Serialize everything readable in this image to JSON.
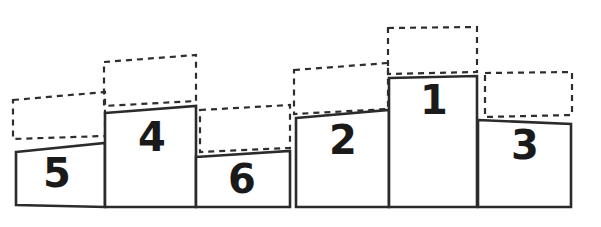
{
  "figure": {
    "background_color": "#ffffff",
    "line_color": "#2b2b2b",
    "dashed_color": "#2e2e2e",
    "label_color": "#1a1a1a",
    "width": 601,
    "height": 227
  },
  "chart_data": {
    "type": "bar",
    "xlabel": "",
    "ylabel": "",
    "grid": false,
    "legend": "none",
    "note": "Two podium groups drawn in perspective. Each solid block carries a rank number; an empty dashed rectangle placeholder sits directly above each block.",
    "categories": [
      "5",
      "4",
      "6",
      "2",
      "1",
      "3"
    ],
    "values": [
      55,
      97,
      51,
      92,
      130,
      85
    ],
    "groups": [
      {
        "name": "left-podium",
        "ranks": [
          "5",
          "4",
          "6"
        ]
      },
      {
        "name": "right-podium",
        "ranks": [
          "2",
          "1",
          "3"
        ]
      }
    ]
  },
  "groups": [
    {
      "id": "left-podium",
      "name": "Left podium group",
      "blocks": [
        {
          "rank": "5",
          "name": "podium-block-5",
          "block_points": "16,152 105,143 105,207 16,205",
          "label_x": 57,
          "label_y": 176,
          "label_size": 40,
          "placeholder_points": "13,100 105,92 105,136 13,139",
          "placeholder_name": "placeholder-above-5"
        },
        {
          "rank": "4",
          "name": "podium-block-4",
          "block_points": "105,113 196,106 196,207 105,207",
          "label_x": 152,
          "label_y": 140,
          "label_size": 44,
          "placeholder_points": "104,62 196,55 196,101 104,106",
          "placeholder_name": "placeholder-above-4"
        },
        {
          "rank": "6",
          "name": "podium-block-6",
          "block_points": "196,157 290,151 290,207 196,207",
          "label_x": 242,
          "label_y": 182,
          "label_size": 40,
          "placeholder_points": "200,110 290,105 290,148 200,152",
          "placeholder_name": "placeholder-above-6"
        }
      ]
    },
    {
      "id": "right-podium",
      "name": "Right podium group",
      "blocks": [
        {
          "rank": "2",
          "name": "podium-block-2",
          "block_points": "296,118 389,110 389,207 296,207",
          "label_x": 343,
          "label_y": 143,
          "label_size": 40,
          "placeholder_points": "294,70 388,63 388,109 294,114",
          "placeholder_name": "placeholder-above-2"
        },
        {
          "rank": "1",
          "name": "podium-block-1",
          "block_points": "389,78 477,76 477,207 389,207",
          "label_x": 434,
          "label_y": 103,
          "label_size": 42,
          "placeholder_points": "388,28 477,27 477,72 388,74",
          "placeholder_name": "placeholder-above-1"
        },
        {
          "rank": "3",
          "name": "podium-block-3",
          "block_points": "478,120 571,124 571,207 478,207",
          "label_x": 525,
          "label_y": 148,
          "label_size": 40,
          "placeholder_points": "485,73 572,72 572,115 485,117",
          "placeholder_name": "placeholder-above-3"
        }
      ]
    }
  ]
}
